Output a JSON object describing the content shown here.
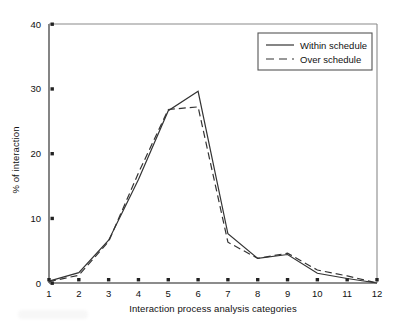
{
  "figure": {
    "background_color": "#ffffff",
    "axis_color": "#555555",
    "series_color": "#333333"
  },
  "chart_data": {
    "type": "line",
    "title": "",
    "xlabel": "Interaction process analysis categories",
    "ylabel": "% of interaction",
    "categories": [
      1,
      2,
      3,
      4,
      5,
      6,
      7,
      8,
      9,
      10,
      11,
      12
    ],
    "xlim": [
      1,
      12
    ],
    "ylim": [
      0,
      40
    ],
    "yticks": [
      0,
      10,
      20,
      30,
      40
    ],
    "xticks": [
      1,
      2,
      3,
      4,
      5,
      6,
      7,
      8,
      9,
      10,
      11,
      12
    ],
    "ytick_labels": [
      "0",
      "10",
      "20",
      "30",
      "40"
    ],
    "xtick_labels": [
      "1",
      "2",
      "3",
      "4",
      "5",
      "6",
      "7",
      "8",
      "9",
      "10",
      "11",
      "12"
    ],
    "grid": false,
    "legend_position": "top-right",
    "series": [
      {
        "name": "Within schedule",
        "style": "solid",
        "values": [
          0.3,
          1.6,
          6.6,
          16.0,
          26.6,
          29.6,
          7.6,
          3.8,
          4.4,
          1.5,
          0.7,
          0.0
        ]
      },
      {
        "name": "Over schedule",
        "style": "dashed",
        "values": [
          0.2,
          1.2,
          6.4,
          17.0,
          26.8,
          27.2,
          6.3,
          3.8,
          4.6,
          2.0,
          1.1,
          0.0
        ]
      }
    ]
  },
  "legend": {
    "entries": [
      {
        "label": "Within schedule",
        "style": "solid"
      },
      {
        "label": "Over schedule",
        "style": "dashed"
      }
    ]
  }
}
